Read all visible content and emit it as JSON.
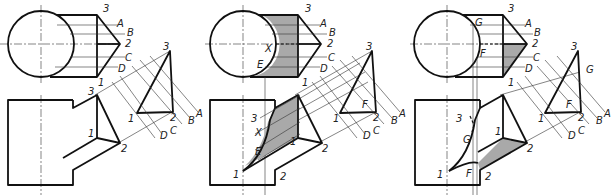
{
  "figure": {
    "panels": [
      {
        "id": "step-1",
        "top_view_labels": [
          "3",
          "A",
          "B",
          "2",
          "C",
          "D",
          "1"
        ],
        "aux_view_labels": [
          "3",
          "1",
          "2",
          "A",
          "B",
          "C",
          "D"
        ],
        "front_view_labels": [
          "3",
          "1",
          "2"
        ]
      },
      {
        "id": "step-2",
        "top_view_labels": [
          "3",
          "A",
          "B",
          "X",
          "2",
          "C",
          "E",
          "D",
          "1"
        ],
        "aux_view_labels": [
          "3",
          "F",
          "1",
          "2",
          "A",
          "B",
          "C",
          "D"
        ],
        "front_view_labels": [
          "3",
          "X",
          "E",
          "1",
          "1",
          "2",
          "2"
        ]
      },
      {
        "id": "step-3",
        "top_view_labels": [
          "G",
          "3",
          "A",
          "B",
          "2",
          "F",
          "C",
          "D",
          "1"
        ],
        "aux_view_labels": [
          "3",
          "G",
          "F",
          "1",
          "2",
          "A",
          "B",
          "C",
          "D"
        ],
        "front_view_labels": [
          "3",
          "G",
          "1",
          "1",
          "F",
          "2",
          "2"
        ]
      }
    ],
    "colors": {
      "line": "#111111",
      "shade": "#a9a9a9",
      "background": "#ffffff"
    }
  }
}
